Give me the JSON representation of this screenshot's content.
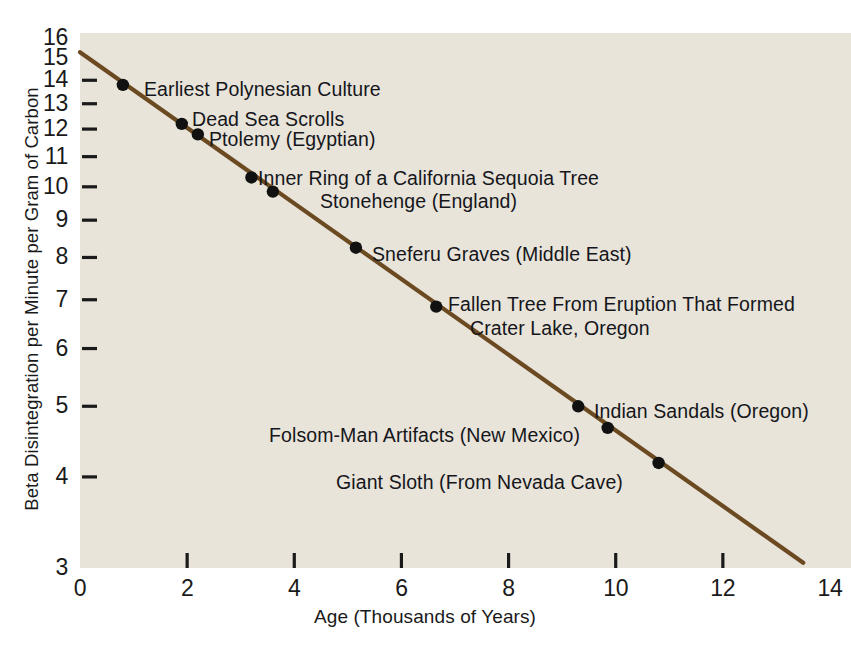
{
  "chart_data": {
    "type": "scatter",
    "title": "",
    "xlabel": "Age (Thousands of Years)",
    "ylabel": "Beta Disintegration per Minute per Gram of Carbon",
    "xlim": [
      0,
      14
    ],
    "ylim": [
      3,
      16
    ],
    "yscale": "log",
    "xscale": "linear",
    "grid": false,
    "legend": "none",
    "background_color": "#e8e4da",
    "line_color": "#6b4a22",
    "point_color": "#111111",
    "xticks": [
      0,
      2,
      4,
      6,
      8,
      10,
      12,
      14
    ],
    "xtick_labels": [
      "0",
      "2",
      "4",
      "6",
      "8",
      "10",
      "12",
      "14"
    ],
    "yticks": [
      3,
      4,
      5,
      6,
      7,
      8,
      9,
      10,
      11,
      12,
      13,
      14,
      15,
      16
    ],
    "ytick_labels": [
      "3",
      "4",
      "5",
      "6",
      "7",
      "8",
      "9",
      "10",
      "11",
      "12",
      "13",
      "14",
      "15",
      "16"
    ],
    "trend_line": {
      "x_start": 0,
      "y_start": 15.3,
      "x_end": 13.5,
      "y_end": 3.05,
      "half_life_years": 5568
    },
    "points": [
      {
        "label": "Earliest Polynesian Culture",
        "x": 0.8,
        "y": 13.8
      },
      {
        "label": "Dead Sea Scrolls",
        "x": 1.9,
        "y": 12.2
      },
      {
        "label": "Ptolemy (Egyptian)",
        "x": 2.2,
        "y": 11.8
      },
      {
        "label": "Inner Ring of a California Sequoia Tree",
        "x": 3.2,
        "y": 10.3
      },
      {
        "label": "Stonehenge (England)",
        "x": 3.6,
        "y": 9.85
      },
      {
        "label": "Sneferu Graves (Middle East)",
        "x": 5.15,
        "y": 8.25
      },
      {
        "label": "Fallen Tree From Eruption That Formed Crater Lake, Oregon",
        "x": 6.65,
        "y": 6.85
      },
      {
        "label": "Indian Sandals (Oregon)",
        "x": 9.3,
        "y": 5.0
      },
      {
        "label": "Folsom-Man Artifacts (New Mexico)",
        "x": 9.85,
        "y": 4.67
      },
      {
        "label": "Giant Sloth (From Nevada Cave)",
        "x": 10.8,
        "y": 4.18
      }
    ],
    "annotations": [
      {
        "text": "Earliest Polynesian Culture",
        "x": 144,
        "y": 78
      },
      {
        "text": "Dead Sea Scrolls",
        "x": 192,
        "y": 108
      },
      {
        "text": "Ptolemy (Egyptian)",
        "x": 209,
        "y": 128
      },
      {
        "text": "Inner Ring of a California Sequoia Tree",
        "x": 258,
        "y": 167
      },
      {
        "text": "Stonehenge (England)",
        "x": 320,
        "y": 190
      },
      {
        "text": "Sneferu Graves (Middle East)",
        "x": 372,
        "y": 243
      },
      {
        "text": "Fallen Tree From Eruption That Formed",
        "x": 448,
        "y": 293
      },
      {
        "text": "Crater Lake, Oregon",
        "x": 470,
        "y": 317
      },
      {
        "text": "Indian Sandals (Oregon)",
        "x": 594,
        "y": 400
      },
      {
        "text": "Folsom-Man Artifacts (New Mexico)",
        "x": 269,
        "y": 424
      },
      {
        "text": "Giant Sloth (From Nevada Cave)",
        "x": 336,
        "y": 471
      }
    ]
  }
}
